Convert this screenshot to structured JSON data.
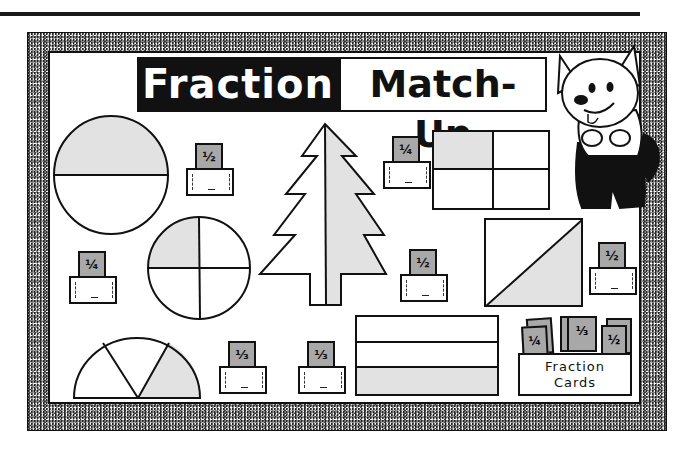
{
  "title": {
    "left_word": "Fraction",
    "right_word": "Match-Up"
  },
  "colors": {
    "ink": "#111111",
    "shade": "#e2e2e2",
    "card_fill": "#a8a8a8",
    "frame_texture": "#8a8a8a"
  },
  "shapes": [
    {
      "id": "circle-halves",
      "type": "circle",
      "parts": 2,
      "shaded": 1,
      "fraction": "1/2"
    },
    {
      "id": "circle-quarters",
      "type": "circle",
      "parts": 4,
      "shaded": 1,
      "fraction": "1/4"
    },
    {
      "id": "semicircle-thirds",
      "type": "semicircle",
      "parts": 3,
      "shaded": 1,
      "fraction": "1/3"
    },
    {
      "id": "tree-halves",
      "type": "tree",
      "parts": 2,
      "shaded": 1,
      "fraction": "1/2"
    },
    {
      "id": "grid-quarters",
      "type": "rectangle-grid",
      "parts": 4,
      "shaded": 1,
      "fraction": "1/4"
    },
    {
      "id": "square-diagonal",
      "type": "square",
      "parts": 2,
      "shaded": 1,
      "fraction": "1/2"
    },
    {
      "id": "stripes-thirds",
      "type": "rectangle-stripes",
      "parts": 3,
      "shaded": 1,
      "fraction": "1/3"
    }
  ],
  "pockets": [
    {
      "card": "½"
    },
    {
      "card": "¼"
    },
    {
      "card": "¼"
    },
    {
      "card": "½"
    },
    {
      "card": "½"
    },
    {
      "card": "⅓"
    },
    {
      "card": "⅓"
    }
  ],
  "cards_box": {
    "line1": "Fraction",
    "line2": "Cards",
    "cards": [
      "¼",
      "⅓",
      "½"
    ]
  },
  "mascot": "cartoon-dog"
}
